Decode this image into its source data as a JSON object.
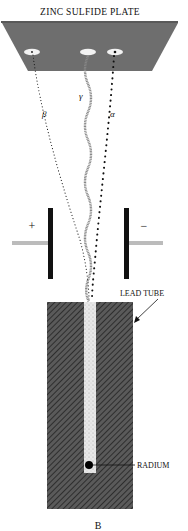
{
  "figure": {
    "plate_label": "ZINC SULFIDE PLATE",
    "tube_label": "LEAD TUBE",
    "source_label": "RADIUM",
    "caption": "B",
    "rays": [
      {
        "id": "beta",
        "label": "β"
      },
      {
        "id": "gamma",
        "label": "γ"
      },
      {
        "id": "alpha",
        "label": "α"
      }
    ],
    "electrodes": [
      {
        "id": "positive",
        "sign": "+"
      },
      {
        "id": "negative",
        "sign": "−"
      }
    ],
    "colors": {
      "plate": "#6e6e6e",
      "tube": "#4a4a4a",
      "ink": "#111111",
      "channel": "#e6e6e6"
    }
  }
}
